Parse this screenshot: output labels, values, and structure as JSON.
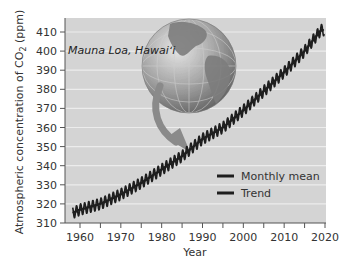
{
  "chart_data": {
    "type": "line",
    "title": "",
    "xlabel": "Year",
    "ylabel": "Atmospheric concentration of CO2 (ppm)",
    "ylabel_parts": {
      "pre": "Atmospheric concentration of CO",
      "sub": "2",
      "post": " (ppm)"
    },
    "xlim": [
      1957,
      2020
    ],
    "ylim": [
      310,
      413
    ],
    "x_ticks": [
      1960,
      1970,
      1980,
      1990,
      2000,
      2010,
      2020
    ],
    "x_minor_ticks": [
      1965,
      1975,
      1985,
      1995,
      2005,
      2015
    ],
    "y_ticks": [
      310,
      320,
      330,
      340,
      350,
      360,
      370,
      380,
      390,
      400,
      410
    ],
    "grid": "horizontal",
    "annotation": "Mauna Loa, Hawaiʻi",
    "legend": {
      "position": "lower right",
      "entries": [
        "Monthly mean",
        "Trend"
      ]
    },
    "seasonal_amplitude_ppm": 6,
    "series": [
      {
        "name": "Trend",
        "x": [
          1958,
          1960,
          1965,
          1970,
          1975,
          1980,
          1985,
          1990,
          1995,
          2000,
          2005,
          2010,
          2015,
          2019
        ],
        "values": [
          315,
          317,
          320,
          325,
          331,
          338,
          345,
          354,
          360,
          369,
          379,
          389,
          400,
          411
        ]
      }
    ]
  },
  "colors": {
    "plot_bg": "#d4d4d4",
    "gridline": "#ececec",
    "line": "#1e1e1e",
    "arrow": "#8a8a8a",
    "axis": "#555555"
  }
}
